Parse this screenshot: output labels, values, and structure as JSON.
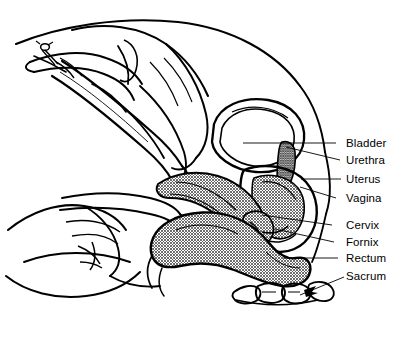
{
  "figure": {
    "type": "line-art-medical-illustration",
    "background_color": "#ffffff",
    "ink_color": "#000000",
    "tissue_fill_color": "#a8a8a8",
    "width": 398,
    "height": 343
  },
  "labels": [
    {
      "id": "bladder",
      "text": "Bladder",
      "x": 346,
      "y": 137,
      "leader": {
        "x1": 336,
        "y1": 143,
        "x2": 243,
        "y2": 143
      }
    },
    {
      "id": "urethra",
      "text": "Urethra",
      "x": 346,
      "y": 154,
      "leader": {
        "x1": 340,
        "y1": 160,
        "x2": 286,
        "y2": 147
      }
    },
    {
      "id": "uterus",
      "text": "Uterus",
      "x": 346,
      "y": 173,
      "leader": {
        "x1": 341,
        "y1": 179,
        "x2": 301,
        "y2": 179
      }
    },
    {
      "id": "vagina",
      "text": "Vagina",
      "x": 346,
      "y": 192,
      "leader": {
        "x1": 336,
        "y1": 198,
        "x2": 300,
        "y2": 187
      }
    },
    {
      "id": "cervix",
      "text": "Cervix",
      "x": 346,
      "y": 219,
      "leader": {
        "x1": 332,
        "y1": 225,
        "x2": 262,
        "y2": 215
      }
    },
    {
      "id": "fornix",
      "text": "Fornix",
      "x": 346,
      "y": 236,
      "leader": {
        "x1": 334,
        "y1": 242,
        "x2": 275,
        "y2": 229
      }
    },
    {
      "id": "rectum",
      "text": "Rectum",
      "x": 346,
      "y": 252,
      "leader": {
        "x1": 338,
        "y1": 258,
        "x2": 283,
        "y2": 258
      }
    },
    {
      "id": "sacrum",
      "text": "Sacrum",
      "x": 346,
      "y": 270,
      "leader": {
        "x1": 344,
        "y1": 277,
        "x2": 300,
        "y2": 295
      }
    }
  ],
  "regions": [
    {
      "id": "upper-hand",
      "name": "examiner-upper-hand-holding-instrument"
    },
    {
      "id": "lower-hand",
      "name": "examiner-lower-hand"
    },
    {
      "id": "instrument",
      "name": "speculum-instrument-shaft"
    },
    {
      "id": "syringe-plunger",
      "name": "instrument-plunger-screw"
    },
    {
      "id": "bladder-organ",
      "name": "bladder"
    },
    {
      "id": "uterus-organ",
      "name": "uterus"
    },
    {
      "id": "vagina-canal",
      "name": "vagina"
    },
    {
      "id": "cervix-organ",
      "name": "cervix"
    },
    {
      "id": "rectum-organ",
      "name": "rectum"
    },
    {
      "id": "sacrum-bone",
      "name": "sacrum-and-coccyx"
    },
    {
      "id": "body-outline",
      "name": "abdominal-and-pelvic-body-outline"
    }
  ]
}
